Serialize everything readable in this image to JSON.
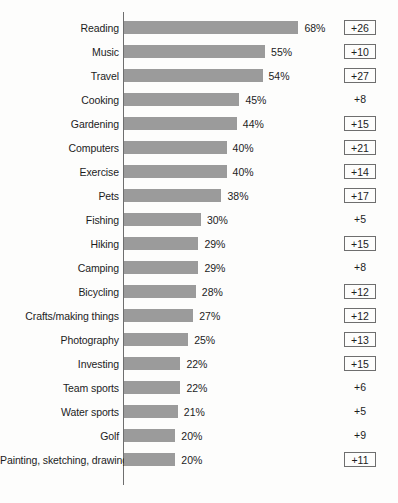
{
  "chart_data": {
    "type": "bar",
    "orientation": "horizontal",
    "title": "",
    "subtitle": "",
    "xlabel": "",
    "ylabel": "",
    "xlim": [
      0,
      68
    ],
    "grid": false,
    "legend": null,
    "categories": [
      "Reading",
      "Music",
      "Travel",
      "Cooking",
      "Gardening",
      "Computers",
      "Exercise",
      "Pets",
      "Fishing",
      "Hiking",
      "Camping",
      "Bicycling",
      "Crafts/making things",
      "Photography",
      "Investing",
      "Team sports",
      "Water sports",
      "Golf",
      "Painting, sketching, drawing"
    ],
    "values": [
      68,
      55,
      54,
      45,
      44,
      40,
      40,
      38,
      30,
      29,
      29,
      28,
      27,
      25,
      22,
      22,
      21,
      20,
      20
    ],
    "value_labels": [
      "68%",
      "55%",
      "54%",
      "45%",
      "44%",
      "40%",
      "40%",
      "38%",
      "30%",
      "29%",
      "29%",
      "28%",
      "27%",
      "25%",
      "22%",
      "22%",
      "21%",
      "20%",
      "20%"
    ],
    "annotations": {
      "name": "index-change",
      "values": [
        26,
        10,
        27,
        8,
        15,
        21,
        14,
        17,
        5,
        15,
        8,
        12,
        12,
        13,
        15,
        6,
        5,
        9,
        11
      ],
      "labels": [
        "+26",
        "+10",
        "+27",
        "+8",
        "+15",
        "+21",
        "+14",
        "+17",
        "+5",
        "+15",
        "+8",
        "+12",
        "+12",
        "+13",
        "+15",
        "+6",
        "+5",
        "+9",
        "+11"
      ],
      "boxed": [
        true,
        true,
        true,
        false,
        true,
        true,
        true,
        true,
        false,
        true,
        false,
        true,
        true,
        true,
        true,
        false,
        false,
        false,
        true
      ]
    },
    "colors": {
      "bar_fill": "#9b9b9b",
      "axis_line": "#6e6e6e",
      "text": "#1c1c1c",
      "background": "#fdfdfc",
      "badge_border": "#6e6e6e"
    }
  }
}
